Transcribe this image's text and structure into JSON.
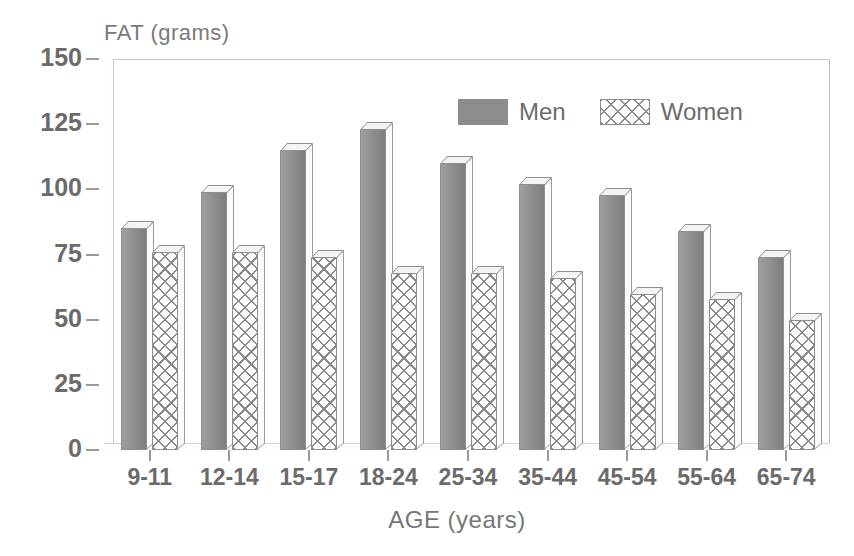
{
  "chart_data": {
    "type": "bar",
    "title": "",
    "xlabel": "AGE (years)",
    "ylabel": "FAT (grams)",
    "categories": [
      "9-11",
      "12-14",
      "15-17",
      "18-24",
      "25-34",
      "35-44",
      "45-54",
      "55-64",
      "65-74"
    ],
    "series": [
      {
        "name": "Men",
        "values": [
          85,
          99,
          115,
          123,
          110,
          102,
          98,
          84,
          74
        ],
        "color": "#8c8c8c",
        "pattern": "solid"
      },
      {
        "name": "Women",
        "values": [
          76,
          76,
          74,
          68,
          68,
          66,
          60,
          58,
          50
        ],
        "color": "#ffffff",
        "pattern": "cross-hatch"
      }
    ],
    "ylim": [
      0,
      150
    ],
    "yticks": [
      0,
      25,
      50,
      75,
      100,
      125,
      150
    ],
    "ytick_labels": [
      "0",
      "25",
      "50",
      "75",
      "100",
      "125",
      "150"
    ],
    "grid": false,
    "legend_position": "top-center",
    "style": "3d-bars-grayscale"
  },
  "axes": {
    "y_title": "FAT (grams)",
    "x_title": "AGE (years)"
  },
  "legend": {
    "items": [
      {
        "label": "Men"
      },
      {
        "label": "Women"
      }
    ]
  }
}
